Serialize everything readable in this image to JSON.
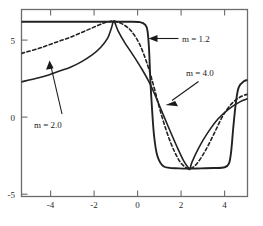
{
  "chart_data": {
    "type": "line",
    "title": "",
    "xlabel": "",
    "ylabel": "",
    "xlim": [
      -5.25,
      5.15
    ],
    "ylim": [
      -5.55,
      6.6
    ],
    "grid": false,
    "legend": "annotations",
    "xticks": [
      -4,
      -2,
      0,
      2,
      4
    ],
    "xtick_labels": [
      "-4",
      "-2",
      "0",
      "2",
      "4"
    ],
    "yticks": [
      5,
      0,
      -5
    ],
    "ytick_labels": [
      "5",
      "0",
      "-5"
    ],
    "annotations": [
      {
        "text": "m = 1.2",
        "points_to_curve": "m = 1.2",
        "arrow": "left",
        "x": 2.35,
        "y": 5.55
      },
      {
        "text": "m = 4.0",
        "points_to_curve": "m = 4.0",
        "arrow": "down-left",
        "x": 3.05,
        "y": 3.2
      },
      {
        "text": "m = 2.0",
        "points_to_curve": "m = 2.0",
        "arrow": "up",
        "x": -3.55,
        "y": -0.55
      }
    ],
    "series": [
      {
        "name": "m = 1.2",
        "style": "solid",
        "color": "#222222",
        "description": "near-square wave: flat plateau at 5.8 from left edge to x=0.55, sharp drop to flat plateau at -3.7 until x=4.35, sharp rise to 2.0 at right edge",
        "x": [
          -5.25,
          -4.0,
          -3.0,
          -2.0,
          -1.2,
          -1.0,
          -0.4,
          0.2,
          0.45,
          0.55,
          0.62,
          0.68,
          0.75,
          0.85,
          1.0,
          1.3,
          2.0,
          2.5,
          3.0,
          3.6,
          4.1,
          4.3,
          4.4,
          4.5,
          4.62,
          4.75,
          5.0,
          5.15
        ],
        "y": [
          5.8,
          5.8,
          5.8,
          5.8,
          5.8,
          5.8,
          5.8,
          5.78,
          5.6,
          5.2,
          4.0,
          2.0,
          0.3,
          -1.6,
          -2.9,
          -3.6,
          -3.72,
          -3.74,
          -3.72,
          -3.7,
          -3.65,
          -3.4,
          -2.6,
          -1.0,
          0.6,
          1.55,
          1.95,
          2.0
        ]
      },
      {
        "name": "m = 2.0",
        "style": "dashed",
        "color": "#222222",
        "description": "smooth sinusoid-like curve, cusp peak 5.85 at x=-1, zero crossing near x=0.8, cusp trough -3.75 at x=2.5, rising to 1.1 at right edge",
        "x": [
          -5.25,
          -4.5,
          -4.0,
          -3.5,
          -3.0,
          -2.5,
          -2.0,
          -1.5,
          -1.2,
          -1.0,
          -0.6,
          -0.2,
          0.2,
          0.55,
          0.8,
          1.2,
          1.6,
          2.0,
          2.3,
          2.5,
          2.8,
          3.2,
          3.6,
          4.0,
          4.4,
          4.8,
          5.15
        ],
        "y": [
          3.75,
          4.05,
          4.3,
          4.55,
          4.8,
          5.1,
          5.4,
          5.7,
          5.82,
          5.85,
          5.65,
          5.2,
          4.3,
          3.0,
          1.8,
          -0.3,
          -2.0,
          -3.2,
          -3.65,
          -3.75,
          -3.45,
          -2.6,
          -1.5,
          -0.35,
          0.45,
          0.9,
          1.1
        ]
      },
      {
        "name": "m = 4.0",
        "style": "solid",
        "color": "#222222",
        "description": "lower-amplitude smooth curve, rises from 1.9 at left edge to cusp peak 5.85 at x=-1, falls through 1.35 near x=0.8 to cusp trough -3.75 at x=2.5, rises to 0.8 at right edge",
        "x": [
          -5.25,
          -4.5,
          -4.0,
          -3.5,
          -3.0,
          -2.5,
          -2.0,
          -1.6,
          -1.3,
          -1.1,
          -1.0,
          -0.8,
          -0.5,
          -0.1,
          0.3,
          0.6,
          0.8,
          1.1,
          1.5,
          1.9,
          2.2,
          2.45,
          2.5,
          2.6,
          2.9,
          3.3,
          3.8,
          4.3,
          4.8,
          5.15
        ],
        "y": [
          1.9,
          2.15,
          2.35,
          2.6,
          2.85,
          3.2,
          3.65,
          4.15,
          4.7,
          5.45,
          5.85,
          5.2,
          4.45,
          3.6,
          2.7,
          1.95,
          1.35,
          0.35,
          -1.0,
          -2.3,
          -3.2,
          -3.72,
          -3.75,
          -3.3,
          -2.4,
          -1.45,
          -0.5,
          0.15,
          0.6,
          0.8
        ]
      }
    ]
  },
  "axes": {
    "frame_color": "#6b6b6b",
    "curve_color": "#222222"
  }
}
